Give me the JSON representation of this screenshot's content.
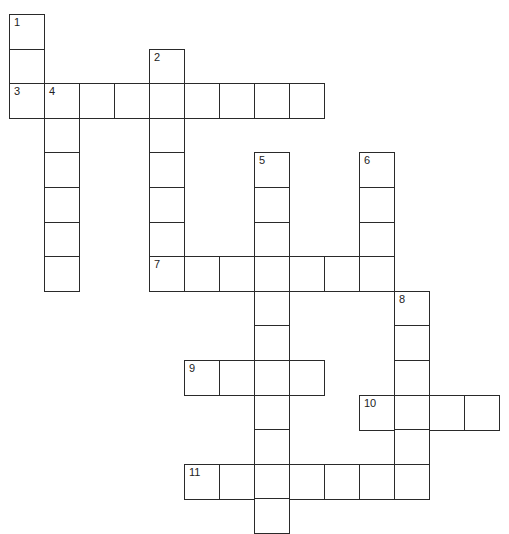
{
  "puzzle": {
    "origin": {
      "x": 9,
      "y": 14
    },
    "cell_w": 35,
    "cell_h": 34.6,
    "entries": [
      {
        "number": "1",
        "direction": "down",
        "col": 0,
        "row": 0,
        "length": 3
      },
      {
        "number": "2",
        "direction": "down",
        "col": 4,
        "row": 1,
        "length": 7
      },
      {
        "number": "3",
        "direction": "across",
        "col": 0,
        "row": 2,
        "length": 9
      },
      {
        "number": "4",
        "direction": "down",
        "col": 1,
        "row": 2,
        "length": 6
      },
      {
        "number": "5",
        "direction": "down",
        "col": 7,
        "row": 4,
        "length": 11
      },
      {
        "number": "6",
        "direction": "down",
        "col": 10,
        "row": 4,
        "length": 4
      },
      {
        "number": "7",
        "direction": "across",
        "col": 4,
        "row": 7,
        "length": 7
      },
      {
        "number": "8",
        "direction": "down",
        "col": 11,
        "row": 8,
        "length": 6
      },
      {
        "number": "9",
        "direction": "across",
        "col": 5,
        "row": 10,
        "length": 4
      },
      {
        "number": "10",
        "direction": "across",
        "col": 10,
        "row": 11,
        "length": 4
      },
      {
        "number": "11",
        "direction": "across",
        "col": 5,
        "row": 13,
        "length": 7
      }
    ]
  },
  "colors": {
    "border": "#2a2a2a",
    "cell": "#ffffff",
    "number": "#222222"
  }
}
